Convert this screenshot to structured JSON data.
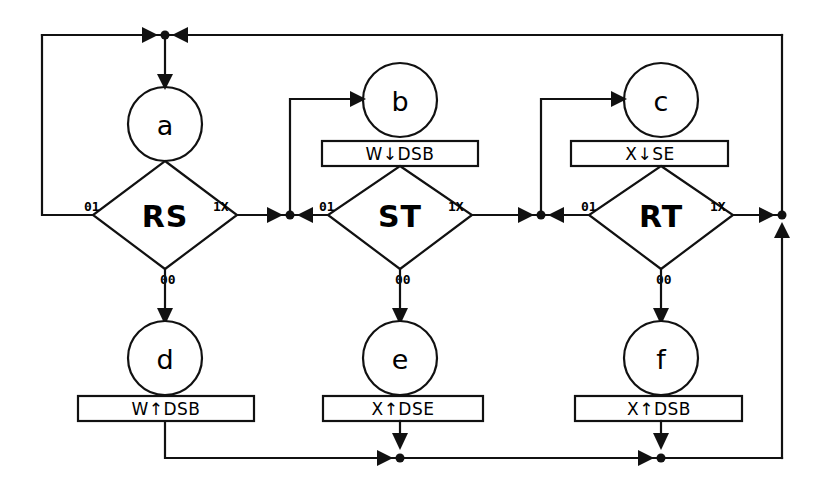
{
  "diagram": {
    "title": "",
    "type": "state-transition-flowchart",
    "background_color": "#ffffff",
    "line_color": "#111111",
    "states": [
      {
        "id": "a",
        "label": "a",
        "cx": 165,
        "cy": 124,
        "r": 37
      },
      {
        "id": "b",
        "label": "b",
        "cx": 400,
        "cy": 100,
        "r": 37
      },
      {
        "id": "c",
        "label": "c",
        "cx": 661,
        "cy": 100,
        "r": 37
      },
      {
        "id": "d",
        "label": "d",
        "cx": 165,
        "cy": 358,
        "r": 37
      },
      {
        "id": "e",
        "label": "e",
        "cx": 400,
        "cy": 358,
        "r": 37
      },
      {
        "id": "f",
        "label": "f",
        "cx": 661,
        "cy": 358,
        "r": 37
      }
    ],
    "decisions": [
      {
        "id": "RS",
        "label": "RS",
        "cx": 165,
        "cy": 215,
        "hw": 72,
        "hh": 54
      },
      {
        "id": "ST",
        "label": "ST",
        "cx": 400,
        "cy": 215,
        "hw": 72,
        "hh": 54
      },
      {
        "id": "RT",
        "label": "RT",
        "cx": 661,
        "cy": 215,
        "hw": 72,
        "hh": 54
      }
    ],
    "actions": [
      {
        "id": "act-b",
        "label": "W↓DSB",
        "x": 322,
        "y": 141,
        "w": 156,
        "h": 25
      },
      {
        "id": "act-c",
        "label": "X↓SE",
        "x": 571,
        "y": 141,
        "w": 157,
        "h": 25
      },
      {
        "id": "act-d",
        "label": "W↑DSB",
        "x": 78,
        "y": 396,
        "w": 176,
        "h": 25
      },
      {
        "id": "act-e",
        "label": "X↑DSE",
        "x": 323,
        "y": 396,
        "w": 160,
        "h": 25
      },
      {
        "id": "act-f",
        "label": "X↑DSB",
        "x": 575,
        "y": 396,
        "w": 167,
        "h": 25
      }
    ],
    "edge_labels": [
      {
        "id": "rs-left",
        "text": "01",
        "x": 95,
        "y": 207
      },
      {
        "id": "rs-right",
        "text": "1X",
        "x": 222,
        "y": 207
      },
      {
        "id": "rs-bottom",
        "text": "00",
        "x": 168,
        "y": 280
      },
      {
        "id": "st-left",
        "text": "01",
        "x": 330,
        "y": 207
      },
      {
        "id": "st-right",
        "text": "1X",
        "x": 458,
        "y": 207
      },
      {
        "id": "st-bottom",
        "text": "00",
        "x": 403,
        "y": 280
      },
      {
        "id": "rt-left",
        "text": "01",
        "x": 592,
        "y": 207
      },
      {
        "id": "rt-right",
        "text": "1X",
        "x": 719,
        "y": 207
      },
      {
        "id": "rt-bottom",
        "text": "00",
        "x": 664,
        "y": 280
      }
    ],
    "junctions": [
      {
        "id": "top-bus-junction",
        "cx": 165,
        "cy": 35
      },
      {
        "id": "rs-out-junction",
        "cx": 290,
        "cy": 215
      },
      {
        "id": "st-out-junction",
        "cx": 541,
        "cy": 215
      },
      {
        "id": "rt-out-junction",
        "cx": 782,
        "cy": 215
      },
      {
        "id": "bottom-bus-junction-e",
        "cx": 400,
        "cy": 458
      },
      {
        "id": "bottom-bus-junction-f",
        "cx": 661,
        "cy": 458
      }
    ]
  }
}
